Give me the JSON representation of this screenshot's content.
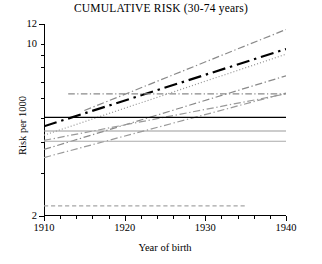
{
  "chart_data": {
    "type": "line",
    "title": "CUMULATIVE RISK (30-74 years)",
    "xlabel": "Year of birth",
    "ylabel": "Risk per 1000",
    "xlim": [
      1910,
      1940
    ],
    "ylim": [
      2,
      12
    ],
    "yscale": "log",
    "xscale": "linear",
    "grid": false,
    "legend": "none",
    "x_major_ticks": [
      1910,
      1920,
      1930,
      1940
    ],
    "x_major_tick_labels": [
      "1910",
      "1920",
      "1930",
      "1940"
    ],
    "x_minor_tick_step": 2,
    "y_major_ticks": [
      2,
      12
    ],
    "y_tick_labels": [
      {
        "value": 12,
        "label": "12"
      },
      {
        "value": 10,
        "label": "10"
      },
      {
        "value": 9,
        "label": ""
      },
      {
        "value": 8,
        "label": ""
      },
      {
        "value": 7,
        "label": ""
      },
      {
        "value": 6,
        "label": ""
      },
      {
        "value": 5,
        "label": ""
      },
      {
        "value": 4,
        "label": ""
      },
      {
        "value": 3,
        "label": ""
      },
      {
        "value": 2,
        "label": "2"
      }
    ],
    "series": [
      {
        "name": "observed-trend-main",
        "style": "dash-dot",
        "color": "#000000",
        "width": 2.2,
        "x": [
          1910,
          1940
        ],
        "y": [
          4.62,
          9.5
        ]
      },
      {
        "name": "projection-steepest",
        "style": "dash-dot",
        "color": "#8a8a8a",
        "width": 1.2,
        "x": [
          1915,
          1940
        ],
        "y": [
          5.35,
          11.4
        ]
      },
      {
        "name": "projection-dotted",
        "style": "dotted",
        "color": "#9a9a9a",
        "width": 1.2,
        "x": [
          1910,
          1940
        ],
        "y": [
          4.25,
          9.05
        ]
      },
      {
        "name": "projection-mid-upper",
        "style": "dash-dot",
        "color": "#8a8a8a",
        "width": 1.2,
        "x": [
          1910,
          1940
        ],
        "y": [
          3.72,
          7.4
        ]
      },
      {
        "name": "projection-mid-lower",
        "style": "dash-dot",
        "color": "#9a9a9a",
        "width": 1.2,
        "x": [
          1910,
          1940
        ],
        "y": [
          3.45,
          6.3
        ]
      },
      {
        "name": "projection-shallow",
        "style": "dash-dot",
        "color": "#9a9a9a",
        "width": 1.2,
        "x": [
          1910,
          1940
        ],
        "y": [
          4.05,
          6.25
        ]
      },
      {
        "name": "reference-constant-black",
        "style": "solid",
        "color": "#000000",
        "width": 1.3,
        "x": [
          1910,
          1940
        ],
        "y": [
          5.02,
          5.02
        ]
      },
      {
        "name": "reference-constant-gray-upper",
        "style": "solid",
        "color": "#9a9a9a",
        "width": 1.1,
        "x": [
          1910,
          1940
        ],
        "y": [
          4.42,
          4.42
        ]
      },
      {
        "name": "reference-constant-gray-lower",
        "style": "solid",
        "color": "#aaaaaa",
        "width": 1.1,
        "x": [
          1910,
          1940
        ],
        "y": [
          4.02,
          4.02
        ]
      },
      {
        "name": "reference-constant-dashdot-high",
        "style": "dash-dot",
        "color": "#8a8a8a",
        "width": 1.1,
        "x": [
          1913,
          1940
        ],
        "y": [
          6.25,
          6.25
        ]
      },
      {
        "name": "reference-constant-dashed-low",
        "style": "dashed",
        "color": "#a5a5a5",
        "width": 1.3,
        "x": [
          1910,
          1935
        ],
        "y": [
          2.2,
          2.2
        ]
      }
    ]
  }
}
